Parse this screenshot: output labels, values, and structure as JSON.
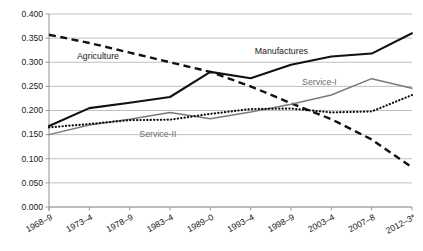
{
  "chart_data": {
    "type": "line",
    "title": "",
    "subtitle": "",
    "xlabel": "",
    "ylabel": "",
    "grid": true,
    "legend_position": "inline-annotations",
    "ylim": [
      0.0,
      0.4
    ],
    "ytick_step": 0.05,
    "categories": [
      "1968–9",
      "1973–4",
      "1978–9",
      "1983–4",
      "1989–0",
      "1993–4",
      "1998–9",
      "2003–4",
      "2007–8",
      "2012–3*"
    ],
    "yticks": [
      "0.000",
      "0.050",
      "0.100",
      "0.150",
      "0.200",
      "0.250",
      "0.300",
      "0.350",
      "0.400"
    ],
    "series": [
      {
        "name": "Manufactures",
        "style": "solid-thick-black",
        "color": "#111111",
        "values": [
          0.168,
          0.205,
          0.216,
          0.228,
          0.28,
          0.267,
          0.295,
          0.312,
          0.318,
          0.36
        ]
      },
      {
        "name": "Agriculture",
        "style": "dashed-thick-black",
        "color": "#111111",
        "values": [
          0.357,
          0.34,
          0.32,
          0.3,
          0.28,
          0.25,
          0.215,
          0.182,
          0.14,
          0.082
        ]
      },
      {
        "name": "Service-I",
        "style": "solid-thin-gray",
        "color": "#7a7a7a",
        "values": [
          0.15,
          0.17,
          0.182,
          0.196,
          0.183,
          0.197,
          0.213,
          0.232,
          0.266,
          0.246
        ]
      },
      {
        "name": "Service-II",
        "style": "dotted-black",
        "color": "#111111",
        "values": [
          0.165,
          0.172,
          0.18,
          0.181,
          0.193,
          0.203,
          0.204,
          0.196,
          0.198,
          0.232
        ]
      }
    ],
    "annotations": [
      {
        "label": "Agriculture",
        "x_frac": 0.135,
        "y_value": 0.306,
        "color": "#1a1a1a"
      },
      {
        "label": "Manufactures",
        "x_frac": 0.64,
        "y_value": 0.317,
        "color": "#1a1a1a"
      },
      {
        "label": "Service-I",
        "x_frac": 0.745,
        "y_value": 0.253,
        "color": "#6d6d6d"
      },
      {
        "label": "Service-II",
        "x_frac": 0.3,
        "y_value": 0.145,
        "color": "#6d6d6d"
      }
    ]
  }
}
